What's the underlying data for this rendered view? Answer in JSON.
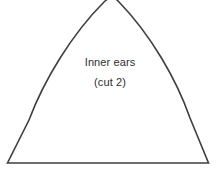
{
  "document": {
    "kind": "sewing-pattern-piece",
    "background_color": "#ffffff"
  },
  "piece": {
    "name": "inner-ear-pattern-piece",
    "shape": "pointed-arch",
    "outline_color": "#3f3f41",
    "fill_color": "#ffffff",
    "stroke_width": 1.6
  },
  "label": {
    "title": "Inner ears",
    "instruction": "(cut 2)",
    "text_color": "#2e2e30"
  }
}
